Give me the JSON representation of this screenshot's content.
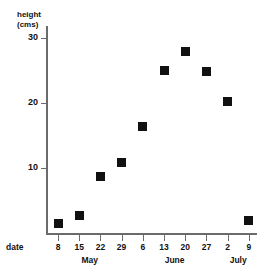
{
  "chart_data": {
    "type": "scatter",
    "title": "",
    "xlabel": "date",
    "ylabel": "height (cms)",
    "ylim": [
      0,
      33
    ],
    "yticks": [
      10,
      20,
      30
    ],
    "ytick_labels": [
      "10",
      "20",
      "30"
    ],
    "grid": false,
    "legend": null,
    "categories": [
      "8",
      "15",
      "22",
      "29",
      "6",
      "13",
      "20",
      "27",
      "2",
      "9"
    ],
    "month_groups": [
      {
        "label": "May",
        "first_index": 0,
        "last_index": 3
      },
      {
        "label": "June",
        "first_index": 4,
        "last_index": 7
      },
      {
        "label": "July",
        "first_index": 8,
        "last_index": 9
      }
    ],
    "points": [
      {
        "x_label": "8",
        "month": "May",
        "value": 1.5
      },
      {
        "x_label": "15",
        "month": "May",
        "value": 2.7
      },
      {
        "x_label": "22",
        "month": "May",
        "value": 8.7
      },
      {
        "x_label": "29",
        "month": "May",
        "value": 10.8
      },
      {
        "x_label": "6",
        "month": "June",
        "value": 16.4
      },
      {
        "x_label": "13",
        "month": "June",
        "value": 25.0
      },
      {
        "x_label": "20",
        "month": "June",
        "value": 27.9
      },
      {
        "x_label": "27",
        "month": "June",
        "value": 24.8
      },
      {
        "x_label": "2",
        "month": "July",
        "value": 20.2
      },
      {
        "x_label": "9",
        "month": "July",
        "value": 1.9
      }
    ],
    "values": [
      1.5,
      2.7,
      8.7,
      10.8,
      16.4,
      25.0,
      27.9,
      24.8,
      20.2,
      1.9
    ],
    "marker": "filled-square",
    "marker_color": "#111111",
    "axis_color": "#6b6b6b"
  }
}
